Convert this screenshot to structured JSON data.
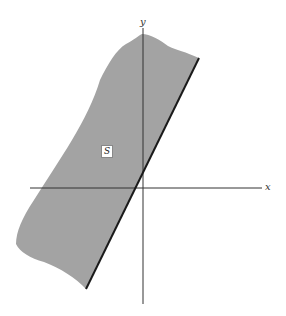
{
  "diagram": {
    "axes": {
      "x_label": "x",
      "y_label": "y"
    },
    "region": {
      "label": "S",
      "fill_color": "#a3a3a3",
      "boundary_color": "#1a1a1a",
      "description": "Half-plane region to the left of a line through the origin (boundary included)"
    },
    "colors": {
      "axis": "#333333",
      "background": "#ffffff"
    }
  }
}
